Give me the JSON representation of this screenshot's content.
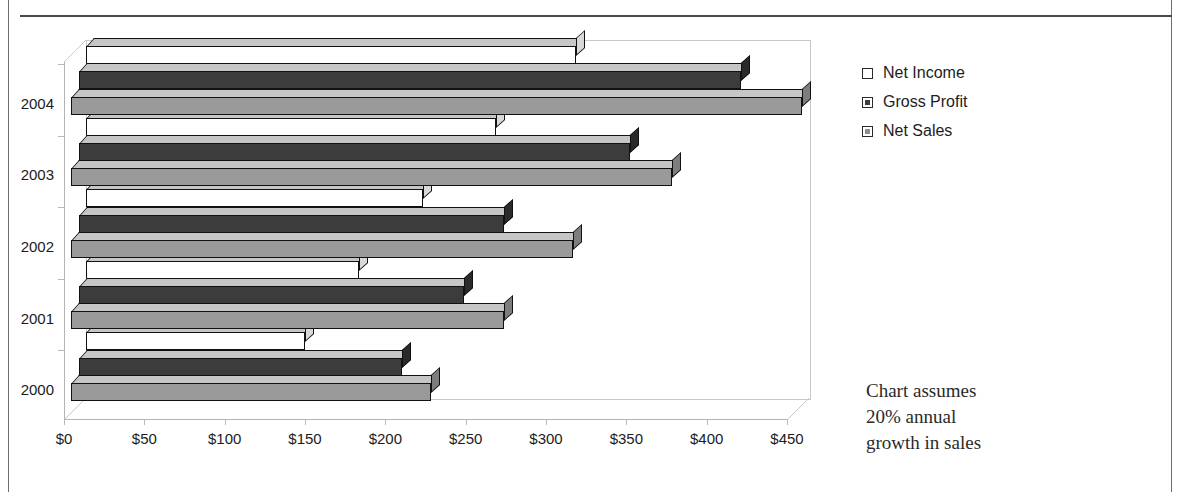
{
  "chart_data": {
    "type": "bar",
    "orientation": "horizontal",
    "grouped_3d": true,
    "title": "",
    "xlabel": "",
    "ylabel": "",
    "categories": [
      "2000",
      "2001",
      "2002",
      "2003",
      "2004"
    ],
    "series": [
      {
        "name": "Net Income",
        "values": [
          136,
          170,
          210,
          255,
          305
        ],
        "color": "#ffffff"
      },
      {
        "name": "Gross Profit",
        "values": [
          201,
          240,
          265,
          343,
          412
        ],
        "color": "#3c3c3c"
      },
      {
        "name": "Net Sales",
        "values": [
          224,
          269,
          312,
          374,
          455
        ],
        "color": "#9a9a9a"
      }
    ],
    "xlim": [
      0,
      450
    ],
    "xticks": [
      0,
      50,
      100,
      150,
      200,
      250,
      300,
      350,
      400,
      450
    ],
    "xtick_labels": [
      "$0",
      "$50",
      "$100",
      "$150",
      "$200",
      "$250",
      "$300",
      "$350",
      "$400",
      "$450"
    ],
    "grid": false,
    "legend_position": "right-top",
    "annotation": "Chart assumes 20% annual growth in sales"
  },
  "legend": {
    "items": [
      {
        "label": "Net Income",
        "key": "ni"
      },
      {
        "label": "Gross Profit",
        "key": "gp"
      },
      {
        "label": "Net Sales",
        "key": "ns"
      }
    ]
  },
  "annotation": {
    "line1": "Chart assumes",
    "line2": "20% annual",
    "line3": "growth in sales"
  },
  "axis": {
    "x_labels": [
      "$0",
      "$50",
      "$100",
      "$150",
      "$200",
      "$250",
      "$300",
      "$350",
      "$400",
      "$450"
    ],
    "y_labels": [
      "2004",
      "2003",
      "2002",
      "2001",
      "2000"
    ]
  }
}
